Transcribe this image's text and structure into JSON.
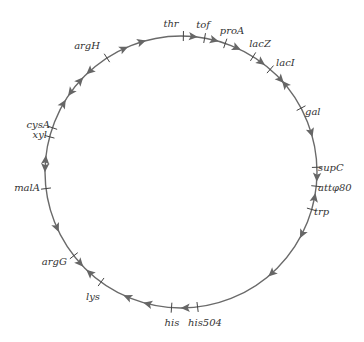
{
  "diagram": {
    "type": "circular-genetic-map",
    "circle": {
      "cx": 181,
      "cy": 172,
      "r": 136,
      "color": "#6a6a6a",
      "stroke_width": 1.4
    },
    "markers": [
      {
        "label": "thr",
        "angle": 1,
        "lx": 171,
        "ly": 27,
        "anchor": "middle"
      },
      {
        "label": "tof",
        "angle": 10,
        "lx": 203,
        "ly": 28,
        "anchor": "middle"
      },
      {
        "label": "proA",
        "angle": 19,
        "lx": 232,
        "ly": 34,
        "anchor": "middle"
      },
      {
        "label": "lacZ",
        "angle": 32,
        "lx": 260,
        "ly": 47,
        "anchor": "middle"
      },
      {
        "label": "lacI",
        "angle": 41,
        "lx": 276,
        "ly": 66,
        "anchor": "start"
      },
      {
        "label": "gal",
        "angle": 62,
        "lx": 305,
        "ly": 115,
        "anchor": "start"
      },
      {
        "label": "supC",
        "angle": 88,
        "lx": 318,
        "ly": 171,
        "anchor": "start"
      },
      {
        "label": "attφ80",
        "angle": 96,
        "lx": 318,
        "ly": 191,
        "anchor": "start"
      },
      {
        "label": "trp",
        "angle": 106,
        "lx": 314,
        "ly": 215,
        "anchor": "start"
      },
      {
        "label": "his504",
        "angle": 173,
        "lx": 205,
        "ly": 326,
        "anchor": "middle"
      },
      {
        "label": "his",
        "angle": 184,
        "lx": 172,
        "ly": 326,
        "anchor": "middle"
      },
      {
        "label": "lys",
        "angle": 216,
        "lx": 93,
        "ly": 300,
        "anchor": "middle"
      },
      {
        "label": "argG",
        "angle": 232,
        "lx": 67,
        "ly": 265,
        "anchor": "end"
      },
      {
        "label": "malA",
        "angle": 263,
        "lx": 40,
        "ly": 191,
        "anchor": "end"
      },
      {
        "label": "xyl",
        "angle": 285,
        "lx": 47,
        "ly": 138,
        "anchor": "end"
      },
      {
        "label": "cysA",
        "angle": 289,
        "lx": 50,
        "ly": 128,
        "anchor": "end"
      },
      {
        "label": "argH",
        "angle": 327,
        "lx": 100,
        "ly": 49,
        "anchor": "end"
      }
    ],
    "arrows": [
      {
        "angle": 5,
        "dir": "cw"
      },
      {
        "angle": 14,
        "dir": "cw"
      },
      {
        "angle": 24,
        "dir": "cw"
      },
      {
        "angle": 36,
        "dir": "cw"
      },
      {
        "angle": 47,
        "dir": "cw"
      },
      {
        "angle": 50,
        "dir": "ccw"
      },
      {
        "angle": 73,
        "dir": "cw"
      },
      {
        "angle": 92,
        "dir": "cw"
      },
      {
        "angle": 101,
        "dir": "ccw"
      },
      {
        "angle": 117,
        "dir": "cw"
      },
      {
        "angle": 138,
        "dir": "cw"
      },
      {
        "angle": 178,
        "dir": "cw"
      },
      {
        "angle": 194,
        "dir": "cw"
      },
      {
        "angle": 203,
        "dir": "cw"
      },
      {
        "angle": 222,
        "dir": "cw"
      },
      {
        "angle": 228,
        "dir": "ccw"
      },
      {
        "angle": 246,
        "dir": "ccw"
      },
      {
        "angle": 272,
        "dir": "ccw"
      },
      {
        "angle": 275,
        "dir": "cw"
      },
      {
        "angle": 300,
        "dir": "cw"
      },
      {
        "angle": 306,
        "dir": "ccw"
      },
      {
        "angle": 312,
        "dir": "cw"
      },
      {
        "angle": 318,
        "dir": "ccw"
      },
      {
        "angle": 335,
        "dir": "cw"
      },
      {
        "angle": 343,
        "dir": "cw"
      }
    ]
  }
}
